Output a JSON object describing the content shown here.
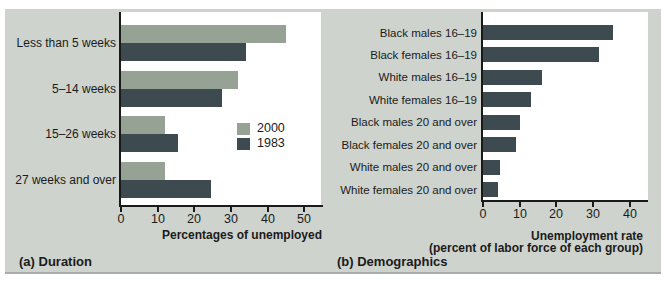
{
  "figure": {
    "panel_background": "#ced3cd",
    "plot_background": "#ffffff",
    "axis_color": "#1a1a1a",
    "text_color": "#1b1b1b"
  },
  "chart_data": [
    {
      "id": "duration",
      "type": "bar",
      "orientation": "horizontal",
      "caption": "(a) Duration",
      "xlabel": "Percentages of unemployed",
      "categories": [
        "Less than 5 weeks",
        "5–14 weeks",
        "15–26 weeks",
        "27 weeks and over"
      ],
      "series": [
        {
          "name": "2000",
          "color": "#95a294",
          "values": [
            45,
            32,
            12,
            12
          ]
        },
        {
          "name": "1983",
          "color": "#3d4a4f",
          "values": [
            34,
            27.5,
            15.5,
            24.5
          ]
        }
      ],
      "xticks": [
        0,
        10,
        20,
        30,
        40,
        50
      ],
      "xlim": [
        0,
        54.5
      ],
      "grid": false,
      "legend_position": "inside-right"
    },
    {
      "id": "demographics",
      "type": "bar",
      "orientation": "horizontal",
      "caption": "(b) Demographics",
      "xlabel": "Unemployment rate",
      "xlabel2": "(percent of labor force of each group)",
      "categories": [
        "Black males 16–19",
        "Black females 16–19",
        "White males 16–19",
        "White females 16–19",
        "Black males 20 and over",
        "Black females 20 and over",
        "White males 20 and over",
        "White females 20 and over"
      ],
      "series": [
        {
          "name": "Unemployment rate",
          "color": "#3d4a4f",
          "values": [
            35.5,
            31.5,
            16,
            13,
            10,
            9,
            4.5,
            4
          ]
        }
      ],
      "xticks": [
        0,
        10,
        20,
        30,
        40
      ],
      "xlim": [
        0,
        45
      ],
      "grid": false,
      "legend_position": "none"
    }
  ]
}
